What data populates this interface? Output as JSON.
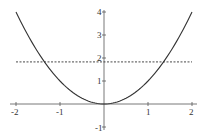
{
  "chart_data": {
    "type": "line",
    "title": "",
    "xlabel": "",
    "ylabel": "",
    "xlim": [
      -2,
      2
    ],
    "ylim": [
      -1,
      4
    ],
    "grid": false,
    "legend": null,
    "x_ticks": [
      -2,
      -1,
      1,
      2
    ],
    "x_tick_labels": [
      "-2",
      "-1",
      "1",
      "2"
    ],
    "y_ticks": [
      4,
      3,
      2,
      1,
      -1
    ],
    "y_tick_labels": [
      "4",
      "3",
      "2",
      "1",
      "-1"
    ],
    "series": [
      {
        "name": "y = x^2",
        "style": "solid",
        "color": "#333333",
        "x": [
          -2,
          -1.5,
          -1.35,
          -1,
          -0.5,
          0,
          0.5,
          1,
          1.35,
          1.5,
          2
        ],
        "y": [
          4,
          2.25,
          1.83,
          1,
          0.25,
          0,
          0.25,
          1,
          1.83,
          2.25,
          4
        ]
      },
      {
        "name": "horizontal line",
        "style": "dashed",
        "color": "#333333",
        "x": [
          -2,
          2
        ],
        "y": [
          1.83,
          1.83
        ]
      }
    ],
    "annotations": [
      {
        "type": "intersection",
        "x": -1.35,
        "y": 1.83
      },
      {
        "type": "intersection",
        "x": 1.35,
        "y": 1.83
      }
    ]
  },
  "axis": {
    "x_labels": [
      "-2",
      "-1",
      "1",
      "2"
    ],
    "y_labels": [
      "4",
      "3",
      "2",
      "1",
      "-1"
    ]
  },
  "colors": {
    "curve": "#333333",
    "axes": "#555555",
    "background": "#ffffff"
  }
}
